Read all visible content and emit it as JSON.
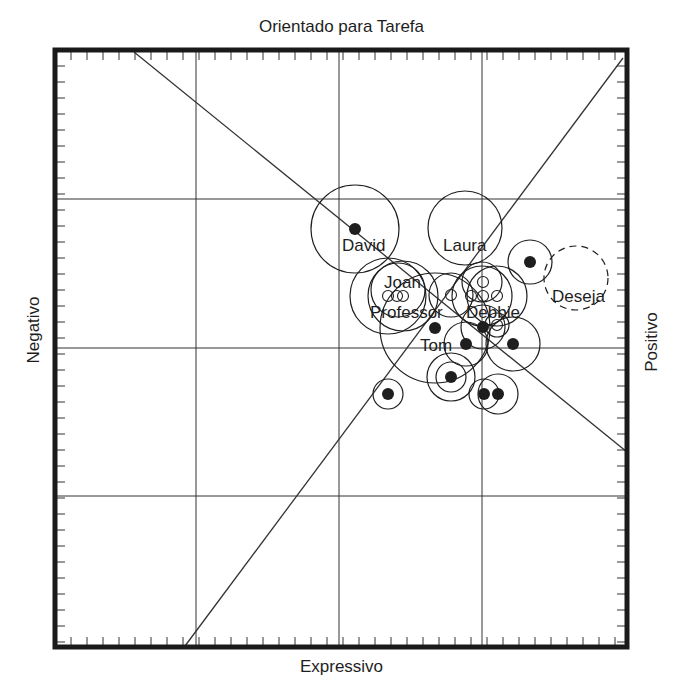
{
  "axes": {
    "top": "Orientado para Tarefa",
    "bottom": "Expressivo",
    "left": "Negativo",
    "right": "Positivo"
  },
  "caption": "",
  "frame": {
    "x0": 55,
    "y0": 50,
    "x1": 627,
    "y1": 647,
    "stroke": "#1a1a1a"
  },
  "grid": {
    "vertical": [
      196,
      339,
      482
    ],
    "horizontal": [
      199,
      348,
      496
    ],
    "tick_spacing": 16
  },
  "diagonals": [
    {
      "name": "descending-diagonal",
      "x1": 134,
      "y1": 52,
      "x2": 627,
      "y2": 452
    },
    {
      "name": "ascending-diagonal",
      "x1": 185,
      "y1": 646,
      "x2": 623,
      "y2": 58
    }
  ],
  "labels": [
    {
      "text": "David",
      "x": 342,
      "y": 251
    },
    {
      "text": "Laura",
      "x": 443,
      "y": 251
    },
    {
      "text": "Joan",
      "x": 384,
      "y": 288
    },
    {
      "text": "Professor",
      "x": 370,
      "y": 318
    },
    {
      "text": "Debbie",
      "x": 466,
      "y": 318
    },
    {
      "text": "Tom",
      "x": 420,
      "y": 351
    },
    {
      "text": "Deseja",
      "x": 552,
      "y": 302
    }
  ],
  "nodes": [
    {
      "name": "david",
      "cx": 355,
      "cy": 229,
      "r": 44,
      "dot": "filled",
      "dashed": false
    },
    {
      "name": "laura",
      "cx": 465,
      "cy": 228,
      "r": 37,
      "dot": "open",
      "dashed": false
    },
    {
      "name": "deseja",
      "cx": 576,
      "cy": 278,
      "r": 32,
      "dot": "open",
      "dashed": true
    },
    {
      "name": "upper-right",
      "cx": 530,
      "cy": 262,
      "r": 22,
      "dot": "filled",
      "dashed": false
    },
    {
      "name": "joan-a",
      "cx": 388,
      "cy": 296,
      "r": 38,
      "dot": "open",
      "dashed": false
    },
    {
      "name": "joan-b",
      "cx": 403,
      "cy": 296,
      "r": 35,
      "dot": "open",
      "dashed": false
    },
    {
      "name": "joan-c",
      "cx": 398,
      "cy": 290,
      "r": 27,
      "dot": "none",
      "dashed": false
    },
    {
      "name": "center-a",
      "cx": 451,
      "cy": 295,
      "r": 22,
      "dot": "open",
      "dashed": false
    },
    {
      "name": "debbie-a",
      "cx": 482,
      "cy": 282,
      "r": 20,
      "dot": "open",
      "dashed": false
    },
    {
      "name": "debbie-b",
      "cx": 482,
      "cy": 296,
      "r": 30,
      "dot": "open",
      "dashed": false
    },
    {
      "name": "debbie-c",
      "cx": 497,
      "cy": 296,
      "r": 30,
      "dot": "open",
      "dashed": false
    },
    {
      "name": "debbie-d",
      "cx": 497,
      "cy": 325,
      "r": 12,
      "dot": "open",
      "dashed": false
    },
    {
      "name": "big-center",
      "cx": 435,
      "cy": 328,
      "r": 55,
      "dot": "filled",
      "dashed": false
    },
    {
      "name": "debbie-dot",
      "cx": 483,
      "cy": 327,
      "r": 22,
      "dot": "filled",
      "dashed": false
    },
    {
      "name": "tom",
      "cx": 466,
      "cy": 344,
      "r": 22,
      "dot": "filled",
      "dashed": false
    },
    {
      "name": "right-mid",
      "cx": 513,
      "cy": 344,
      "r": 27,
      "dot": "filled",
      "dashed": false
    },
    {
      "name": "lower-a-outer",
      "cx": 451,
      "cy": 377,
      "r": 24,
      "dot": "filled",
      "dashed": false
    },
    {
      "name": "lower-a-inner",
      "cx": 451,
      "cy": 377,
      "r": 15,
      "dot": "none",
      "dashed": false
    },
    {
      "name": "lower-left",
      "cx": 388,
      "cy": 394,
      "r": 15,
      "dot": "filled",
      "dashed": false
    },
    {
      "name": "lower-b",
      "cx": 484,
      "cy": 394,
      "r": 15,
      "dot": "filled",
      "dashed": false
    },
    {
      "name": "lower-c",
      "cx": 498,
      "cy": 394,
      "r": 20,
      "dot": "filled",
      "dashed": false
    }
  ],
  "small_open_markers": [
    {
      "cx": 388,
      "cy": 296
    },
    {
      "cx": 403,
      "cy": 296
    },
    {
      "cx": 397,
      "cy": 296
    },
    {
      "cx": 451,
      "cy": 295
    },
    {
      "cx": 483,
      "cy": 282
    },
    {
      "cx": 471,
      "cy": 296
    },
    {
      "cx": 483,
      "cy": 296
    },
    {
      "cx": 497,
      "cy": 296
    },
    {
      "cx": 497,
      "cy": 325
    }
  ],
  "colors": {
    "ink": "#1e1e1e",
    "line": "#333333",
    "background": "#ffffff"
  }
}
